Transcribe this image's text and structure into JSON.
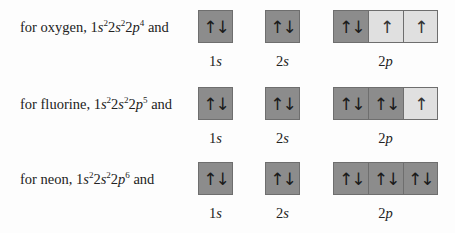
{
  "diagram": {
    "colors": {
      "filled_cell": "#8c8c8c",
      "half_filled_cell": "#e0e0e0",
      "border": "#6e6e6e"
    },
    "rows": [
      {
        "element": "oxygen",
        "prefix": "for oxygen, ",
        "configuration": [
          {
            "n": "1",
            "l": "s",
            "e": "2"
          },
          {
            "n": "2",
            "l": "s",
            "e": "2"
          },
          {
            "n": "2",
            "l": "p",
            "e": "4"
          }
        ],
        "suffix": " and",
        "orbitals": [
          {
            "label_n": "1",
            "label_l": "s",
            "cells": [
              {
                "spin": "↑↓",
                "state": "filled"
              }
            ]
          },
          {
            "label_n": "2",
            "label_l": "s",
            "cells": [
              {
                "spin": "↑↓",
                "state": "filled"
              }
            ]
          },
          {
            "label_n": "2",
            "label_l": "p",
            "cells": [
              {
                "spin": "↑↓",
                "state": "filled"
              },
              {
                "spin": "↑",
                "state": "half"
              },
              {
                "spin": "↑",
                "state": "half"
              }
            ]
          }
        ]
      },
      {
        "element": "fluorine",
        "prefix": "for fluorine, ",
        "configuration": [
          {
            "n": "1",
            "l": "s",
            "e": "2"
          },
          {
            "n": "2",
            "l": "s",
            "e": "2"
          },
          {
            "n": "2",
            "l": "p",
            "e": "5"
          }
        ],
        "suffix": " and",
        "orbitals": [
          {
            "label_n": "1",
            "label_l": "s",
            "cells": [
              {
                "spin": "↑↓",
                "state": "filled"
              }
            ]
          },
          {
            "label_n": "2",
            "label_l": "s",
            "cells": [
              {
                "spin": "↑↓",
                "state": "filled"
              }
            ]
          },
          {
            "label_n": "2",
            "label_l": "p",
            "cells": [
              {
                "spin": "↑↓",
                "state": "filled"
              },
              {
                "spin": "↑↓",
                "state": "filled"
              },
              {
                "spin": "↑",
                "state": "half"
              }
            ]
          }
        ]
      },
      {
        "element": "neon",
        "prefix": "for neon, ",
        "configuration": [
          {
            "n": "1",
            "l": "s",
            "e": "2"
          },
          {
            "n": "2",
            "l": "s",
            "e": "2"
          },
          {
            "n": "2",
            "l": "p",
            "e": "6"
          }
        ],
        "suffix": " and",
        "orbitals": [
          {
            "label_n": "1",
            "label_l": "s",
            "cells": [
              {
                "spin": "↑↓",
                "state": "filled"
              }
            ]
          },
          {
            "label_n": "2",
            "label_l": "s",
            "cells": [
              {
                "spin": "↑↓",
                "state": "filled"
              }
            ]
          },
          {
            "label_n": "2",
            "label_l": "p",
            "cells": [
              {
                "spin": "↑↓",
                "state": "filled"
              },
              {
                "spin": "↑↓",
                "state": "filled"
              },
              {
                "spin": "↑↓",
                "state": "filled"
              }
            ]
          }
        ]
      }
    ]
  }
}
